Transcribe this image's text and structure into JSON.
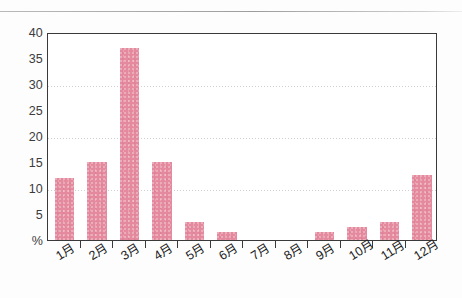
{
  "chart_data": {
    "type": "bar",
    "title": "",
    "subtitle": "",
    "xlabel": "",
    "ylabel": "%",
    "categories": [
      "1月",
      "2月",
      "3月",
      "4月",
      "5月",
      "6月",
      "7月",
      "8月",
      "9月",
      "10月",
      "11月",
      "12月"
    ],
    "values": [
      12,
      15,
      37,
      15,
      3.5,
      1.5,
      0,
      0,
      1.5,
      2.5,
      3.5,
      12.5
    ],
    "series": [
      {
        "name": "",
        "values": [
          12,
          15,
          37,
          15,
          3.5,
          1.5,
          0,
          0,
          1.5,
          2.5,
          3.5,
          12.5
        ]
      }
    ],
    "ylim": [
      0,
      40
    ],
    "yticks": [
      0,
      5,
      10,
      15,
      20,
      25,
      30,
      35,
      40
    ],
    "ytick_labels": [
      "%",
      "5",
      "10",
      "15",
      "20",
      "25",
      "30",
      "35",
      "40"
    ],
    "gridlines_at": [
      10,
      20,
      30
    ],
    "tickmarks_at": [
      5,
      15,
      25,
      35
    ],
    "grid": true,
    "legend": null,
    "legend_position": "none",
    "bar_color": "#e4899e",
    "axis_color": "#3a3a3a",
    "grid_color": "#c8c8cc"
  },
  "figure": {
    "top_rule": "horizontal-rule"
  }
}
